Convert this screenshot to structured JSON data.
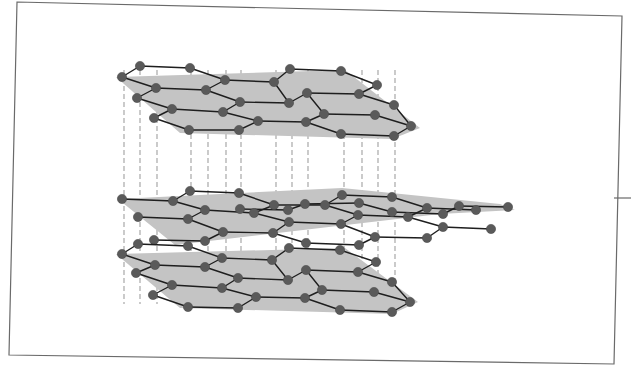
{
  "diagram": {
    "title": "",
    "colors": {
      "frame": "#6a6a6a",
      "sheet": "#c4c4c4",
      "bond": "#1e1e1e",
      "atom": "#5a5a5a",
      "interlayer_link": "#a8a8a8",
      "background": "#ffffff"
    },
    "frame": {
      "points": [
        [
          17,
          2
        ],
        [
          622,
          16
        ],
        [
          614,
          364
        ],
        [
          9,
          355
        ]
      ],
      "edge_tick": [
        [
          614,
          198
        ],
        [
          631,
          198
        ]
      ]
    },
    "layers": [
      {
        "name": "top-layer",
        "sheet": [
          [
            116,
            77
          ],
          [
            345,
            70
          ],
          [
            420,
            128
          ],
          [
            392,
            139
          ],
          [
            180,
            133
          ]
        ],
        "atoms": [
          [
            122,
            77
          ],
          [
            140,
            66
          ],
          [
            190,
            68
          ],
          [
            225,
            80
          ],
          [
            274,
            82
          ],
          [
            290,
            69
          ],
          [
            341,
            71
          ],
          [
            377,
            85
          ],
          [
            156,
            88
          ],
          [
            206,
            90
          ],
          [
            240,
            102
          ],
          [
            289,
            103
          ],
          [
            307,
            93
          ],
          [
            359,
            94
          ],
          [
            394,
            105
          ],
          [
            137,
            98
          ],
          [
            172,
            109
          ],
          [
            223,
            112
          ],
          [
            258,
            121
          ],
          [
            306,
            122
          ],
          [
            324,
            114
          ],
          [
            375,
            115
          ],
          [
            411,
            126
          ],
          [
            154,
            118
          ],
          [
            189,
            130
          ],
          [
            239,
            130
          ],
          [
            341,
            134
          ],
          [
            394,
            136
          ]
        ],
        "bonds": [
          [
            122,
            77,
            140,
            66
          ],
          [
            140,
            66,
            190,
            68
          ],
          [
            190,
            68,
            225,
            80
          ],
          [
            225,
            80,
            274,
            82
          ],
          [
            274,
            82,
            290,
            69
          ],
          [
            290,
            69,
            341,
            71
          ],
          [
            341,
            71,
            377,
            85
          ],
          [
            122,
            77,
            156,
            88
          ],
          [
            156,
            88,
            206,
            90
          ],
          [
            206,
            90,
            240,
            102
          ],
          [
            240,
            102,
            289,
            103
          ],
          [
            289,
            103,
            307,
            93
          ],
          [
            307,
            93,
            359,
            94
          ],
          [
            359,
            94,
            394,
            105
          ],
          [
            156,
            88,
            137,
            98
          ],
          [
            206,
            90,
            225,
            80
          ],
          [
            240,
            102,
            223,
            112
          ],
          [
            289,
            103,
            274,
            82
          ],
          [
            307,
            93,
            324,
            114
          ],
          [
            359,
            94,
            377,
            85
          ],
          [
            394,
            105,
            411,
            126
          ],
          [
            137,
            98,
            172,
            109
          ],
          [
            172,
            109,
            223,
            112
          ],
          [
            223,
            112,
            258,
            121
          ],
          [
            258,
            121,
            306,
            122
          ],
          [
            306,
            122,
            324,
            114
          ],
          [
            324,
            114,
            375,
            115
          ],
          [
            375,
            115,
            411,
            126
          ],
          [
            172,
            109,
            154,
            118
          ],
          [
            154,
            118,
            189,
            130
          ],
          [
            189,
            130,
            239,
            130
          ],
          [
            239,
            130,
            258,
            121
          ],
          [
            306,
            122,
            341,
            134
          ],
          [
            341,
            134,
            394,
            136
          ],
          [
            394,
            136,
            411,
            126
          ]
        ]
      },
      {
        "name": "middle-layer",
        "sheet": [
          [
            118,
            199
          ],
          [
            342,
            188
          ],
          [
            500,
            204
          ],
          [
            515,
            210
          ],
          [
            440,
            214
          ],
          [
            175,
            245
          ]
        ],
        "atoms": [
          [
            122,
            199
          ],
          [
            173,
            201
          ],
          [
            190,
            191
          ],
          [
            239,
            193
          ],
          [
            274,
            205
          ],
          [
            325,
            205
          ],
          [
            342,
            195
          ],
          [
            392,
            197
          ],
          [
            427,
            208
          ],
          [
            476,
            210
          ],
          [
            138,
            217
          ],
          [
            188,
            219
          ],
          [
            205,
            210
          ],
          [
            254,
            213
          ],
          [
            289,
            222
          ],
          [
            341,
            224
          ],
          [
            358,
            215
          ],
          [
            408,
            217
          ],
          [
            443,
            227
          ],
          [
            491,
            229
          ],
          [
            154,
            240
          ],
          [
            205,
            241
          ],
          [
            223,
            232
          ],
          [
            273,
            233
          ],
          [
            306,
            243
          ],
          [
            359,
            245
          ],
          [
            375,
            237
          ],
          [
            427,
            238
          ],
          [
            240,
            209
          ],
          [
            288,
            210
          ],
          [
            305,
            204
          ],
          [
            359,
            203
          ],
          [
            392,
            212
          ],
          [
            443,
            214
          ],
          [
            459,
            206
          ],
          [
            508,
            207
          ]
        ],
        "bonds": [
          [
            122,
            199,
            173,
            201
          ],
          [
            173,
            201,
            190,
            191
          ],
          [
            190,
            191,
            239,
            193
          ],
          [
            239,
            193,
            274,
            205
          ],
          [
            274,
            205,
            325,
            205
          ],
          [
            325,
            205,
            342,
            195
          ],
          [
            342,
            195,
            392,
            197
          ],
          [
            392,
            197,
            427,
            208
          ],
          [
            427,
            208,
            476,
            210
          ],
          [
            173,
            201,
            205,
            210
          ],
          [
            274,
            205,
            254,
            213
          ],
          [
            325,
            205,
            358,
            215
          ],
          [
            427,
            208,
            408,
            217
          ],
          [
            138,
            217,
            188,
            219
          ],
          [
            188,
            219,
            205,
            210
          ],
          [
            205,
            210,
            254,
            213
          ],
          [
            254,
            213,
            289,
            222
          ],
          [
            289,
            222,
            341,
            224
          ],
          [
            341,
            224,
            358,
            215
          ],
          [
            358,
            215,
            408,
            217
          ],
          [
            408,
            217,
            443,
            227
          ],
          [
            443,
            227,
            491,
            229
          ],
          [
            188,
            219,
            223,
            232
          ],
          [
            289,
            222,
            273,
            233
          ],
          [
            341,
            224,
            375,
            237
          ],
          [
            443,
            227,
            427,
            238
          ],
          [
            154,
            240,
            205,
            241
          ],
          [
            205,
            241,
            223,
            232
          ],
          [
            223,
            232,
            273,
            233
          ],
          [
            273,
            233,
            306,
            243
          ],
          [
            306,
            243,
            359,
            245
          ],
          [
            359,
            245,
            375,
            237
          ],
          [
            375,
            237,
            427,
            238
          ],
          [
            240,
            209,
            288,
            210
          ],
          [
            288,
            210,
            305,
            204
          ],
          [
            305,
            204,
            359,
            203
          ],
          [
            359,
            203,
            392,
            212
          ],
          [
            392,
            212,
            443,
            214
          ],
          [
            443,
            214,
            459,
            206
          ],
          [
            459,
            206,
            508,
            207
          ]
        ]
      },
      {
        "name": "bottom-layer",
        "sheet": [
          [
            116,
            314
          ],
          [
            345,
            308
          ],
          [
            418,
            362
          ],
          [
            392,
            374
          ],
          [
            180,
            368
          ]
        ],
        "atoms": [
          [
            122,
            314
          ],
          [
            138,
            304
          ],
          [
            188,
            306
          ],
          [
            222,
            318
          ],
          [
            272,
            320
          ],
          [
            289,
            308
          ],
          [
            340,
            310
          ],
          [
            376,
            322
          ],
          [
            155,
            325
          ],
          [
            205,
            327
          ],
          [
            238,
            338
          ],
          [
            288,
            340
          ],
          [
            306,
            330
          ],
          [
            358,
            332
          ],
          [
            392,
            342
          ],
          [
            136,
            333
          ],
          [
            172,
            345
          ],
          [
            222,
            348
          ],
          [
            256,
            357
          ],
          [
            305,
            358
          ],
          [
            322,
            350
          ],
          [
            374,
            352
          ],
          [
            410,
            362
          ],
          [
            153,
            355
          ],
          [
            188,
            367
          ],
          [
            238,
            368
          ],
          [
            340,
            370
          ],
          [
            392,
            372
          ]
        ],
        "bonds": [
          [
            122,
            314,
            138,
            304
          ],
          [
            138,
            304,
            188,
            306
          ],
          [
            188,
            306,
            222,
            318
          ],
          [
            222,
            318,
            272,
            320
          ],
          [
            272,
            320,
            289,
            308
          ],
          [
            289,
            308,
            340,
            310
          ],
          [
            340,
            310,
            376,
            322
          ],
          [
            122,
            314,
            155,
            325
          ],
          [
            155,
            325,
            205,
            327
          ],
          [
            205,
            327,
            238,
            338
          ],
          [
            238,
            338,
            288,
            340
          ],
          [
            288,
            340,
            306,
            330
          ],
          [
            306,
            330,
            358,
            332
          ],
          [
            358,
            332,
            392,
            342
          ],
          [
            155,
            325,
            136,
            333
          ],
          [
            205,
            327,
            222,
            318
          ],
          [
            238,
            338,
            222,
            348
          ],
          [
            288,
            340,
            272,
            320
          ],
          [
            306,
            330,
            322,
            350
          ],
          [
            358,
            332,
            376,
            322
          ],
          [
            392,
            342,
            410,
            362
          ],
          [
            136,
            333,
            172,
            345
          ],
          [
            172,
            345,
            222,
            348
          ],
          [
            222,
            348,
            256,
            357
          ],
          [
            256,
            357,
            305,
            358
          ],
          [
            305,
            358,
            322,
            350
          ],
          [
            322,
            350,
            374,
            352
          ],
          [
            374,
            352,
            410,
            362
          ],
          [
            172,
            345,
            153,
            355
          ],
          [
            153,
            355,
            188,
            367
          ],
          [
            188,
            367,
            238,
            368
          ],
          [
            238,
            368,
            256,
            357
          ],
          [
            305,
            358,
            340,
            370
          ],
          [
            340,
            370,
            392,
            372
          ],
          [
            392,
            372,
            410,
            362
          ]
        ]
      }
    ],
    "interlayer_links_x": [
      124,
      140,
      157,
      191,
      208,
      226,
      241,
      276,
      292,
      308,
      344,
      362,
      378,
      395
    ],
    "interlayer_link_spans": [
      [
        70,
        320
      ]
    ]
  }
}
